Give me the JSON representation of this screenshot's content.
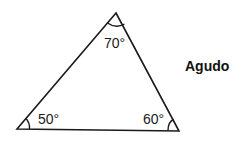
{
  "diagram": {
    "classification_label": "Agudo",
    "vertices": {
      "top": {
        "x": 116,
        "y": 13
      },
      "bottom_left": {
        "x": 17,
        "y": 129
      },
      "bottom_right": {
        "x": 179,
        "y": 131
      }
    },
    "angles": {
      "top": "70°",
      "bottom_left": "50°",
      "bottom_right": "60°"
    },
    "colors": {
      "stroke": "#1a1a1a",
      "background": "#ffffff"
    }
  }
}
